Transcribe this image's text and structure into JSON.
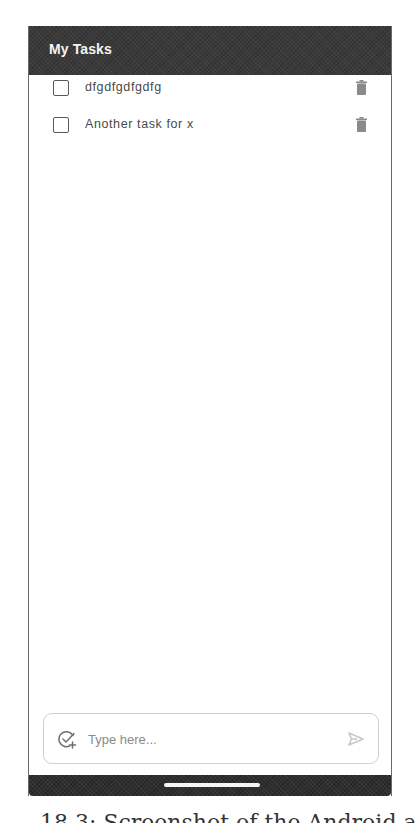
{
  "app": {
    "title": "My Tasks"
  },
  "tasks": [
    {
      "label": "dfgdfgdfgdfg",
      "checked": false,
      "delete_icon": "trash-icon"
    },
    {
      "label": "Another task for x",
      "checked": false,
      "delete_icon": "trash-icon"
    }
  ],
  "composer": {
    "placeholder": "Type here...",
    "value": "",
    "leading_icon": "add-task-icon",
    "send_icon": "send-icon"
  },
  "nav_bar": {
    "handle": "home-handle"
  },
  "caption": {
    "text": "18.3: Screenshot of the Android app displ"
  },
  "colors": {
    "app_bar": "#3a3a3a",
    "app_title": "#f4f4f4",
    "task_text": "#4a4a4a",
    "trash": "#8a8a8a",
    "input_border": "#cfcfcf",
    "placeholder": "#8a8a8a",
    "send_icon": "#c8c8c8",
    "nav_bar": "#2e2e2e"
  }
}
